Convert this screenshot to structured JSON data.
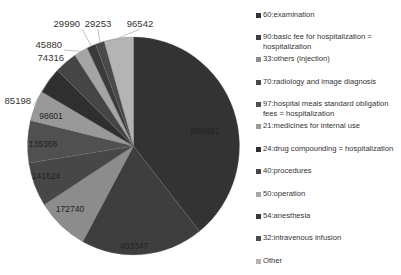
{
  "chart_data": {
    "type": "pie",
    "title": "",
    "start_angle_deg": 0,
    "direction": "clockwise",
    "legend_position": "right",
    "categories": [
      "60:examination",
      "90:basic fee for hospitalization = hospitalization",
      "33:others (injection)",
      "70:radiology and image diagnosis",
      "97:hospital meals standard obligation fees = hospitalization",
      "21:medicines for internal use",
      "24:drug compounding = hospitalization",
      "40:procedures",
      "50:operation",
      "54:anesthesia",
      "32:intravenous infusion",
      "Other"
    ],
    "values": [
      850491,
      403347,
      172740,
      141624,
      135368,
      98601,
      85198,
      74316,
      45880,
      29990,
      29253,
      96542
    ],
    "data_labels": [
      "850491",
      "403347",
      "172740",
      "141624",
      "135368",
      "98601",
      "85198",
      "74316",
      "45880",
      "29990",
      "29253",
      "96542"
    ],
    "colors": [
      "#333333",
      "#3e3e3e",
      "#8c8c8c",
      "#474747",
      "#505050",
      "#999999",
      "#2f2f2f",
      "#454545",
      "#a5a5a5",
      "#3a3a3a",
      "#4a4a4a",
      "#b4b4b4"
    ]
  },
  "legend": {
    "items": [
      {
        "label": "60:examination",
        "top": 14
      },
      {
        "label": "90:basic fee for hospitalization = hospitalization",
        "top": 36
      },
      {
        "label": "33:others (injection)",
        "top": 58
      },
      {
        "label": "70:radiology and image diagnosis",
        "top": 81
      },
      {
        "label": "97:hospital meals standard obligation fees = hospitalization",
        "top": 103
      },
      {
        "label": "21:medicines for internal use",
        "top": 125
      },
      {
        "label": "24:drug compounding = hospitalization",
        "top": 148
      },
      {
        "label": "40:procedures",
        "top": 170
      },
      {
        "label": "50:operation",
        "top": 193
      },
      {
        "label": "54:anesthesia",
        "top": 215
      },
      {
        "label": "32:intravenous infusion",
        "top": 237
      },
      {
        "label": "Other",
        "top": 260
      }
    ]
  }
}
